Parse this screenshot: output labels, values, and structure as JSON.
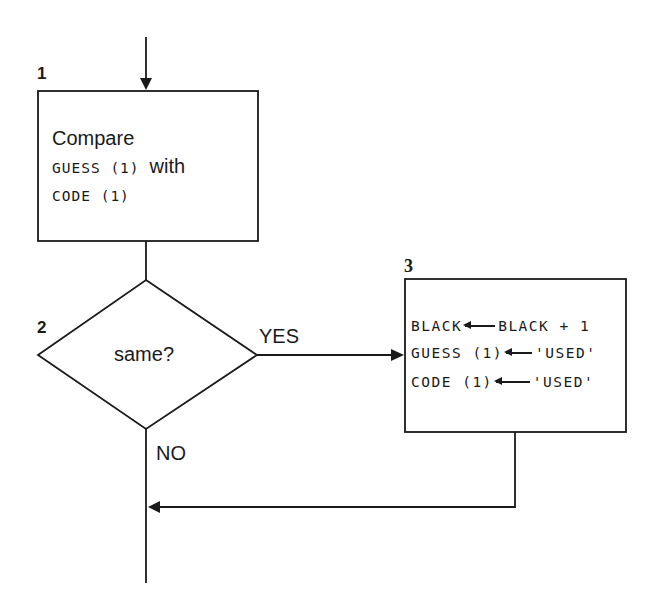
{
  "flowchart": {
    "nodes": [
      {
        "id": "1",
        "number": "1",
        "type": "process",
        "line1": "Compare",
        "line2_code": "GUESS (1)",
        "line2_text": "with",
        "line3_code": "CODE (1)"
      },
      {
        "id": "2",
        "number": "2",
        "type": "decision",
        "text": "same?"
      },
      {
        "id": "3",
        "number": "3",
        "type": "process",
        "statements": [
          {
            "target": "BLACK",
            "value": "BLACK + 1"
          },
          {
            "target": "GUESS (1)",
            "value": "'USED'"
          },
          {
            "target": "CODE (1)",
            "value": "'USED'"
          }
        ]
      }
    ],
    "edges": [
      {
        "from": "entry",
        "to": "1"
      },
      {
        "from": "1",
        "to": "2"
      },
      {
        "from": "2",
        "to": "3",
        "label": "YES"
      },
      {
        "from": "2",
        "to": "exit",
        "label": "NO"
      },
      {
        "from": "3",
        "to": "exit-merge"
      }
    ],
    "colors": {
      "stroke": "#1a1a1a",
      "background": "#ffffff"
    }
  }
}
